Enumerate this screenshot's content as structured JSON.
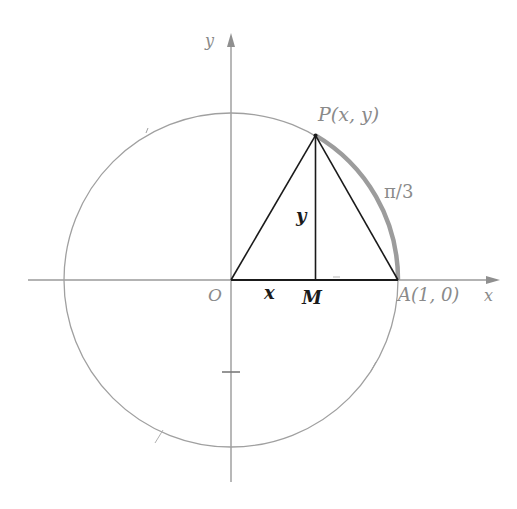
{
  "figure": {
    "colors": {
      "axis": "#9a9a9a",
      "circle": "#9a9a9a",
      "triangle": "#1a1a1a",
      "arc_highlight": "#9c9c9c",
      "label_gray": "#8a8a8a",
      "label_dark": "#1a1a1a"
    },
    "geometry": {
      "origin": [
        231,
        280
      ],
      "radius": 167,
      "angle_deg": 60
    },
    "labels": {
      "y_axis": "y",
      "x_axis": "x",
      "origin": "O",
      "point_p": "P(x, y)",
      "arc": "π/3",
      "segment_y": "y",
      "segment_x": "x",
      "point_m": "M",
      "point_a": "A(1, 0)"
    }
  }
}
